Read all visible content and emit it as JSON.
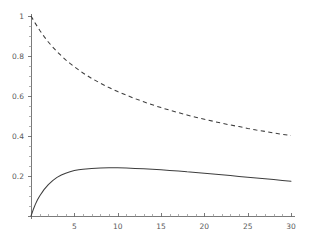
{
  "chart_data": {
    "type": "line",
    "title": "",
    "subtitle": "",
    "xlabel": "",
    "ylabel": "",
    "xlim": [
      0,
      30
    ],
    "ylim": [
      0,
      1
    ],
    "grid": false,
    "legend": "none",
    "background_color": "#ffffff",
    "axis_color": "#6b6b6b",
    "curve_color": "#3d3d3d",
    "x_ticks_major": [
      5,
      10,
      15,
      20,
      25,
      30
    ],
    "x_tick_labels": [
      "5",
      "10",
      "15",
      "20",
      "25",
      "30"
    ],
    "x_tick_minor_step": 1,
    "y_ticks_major": [
      0.2,
      0.4,
      0.6,
      0.8,
      1
    ],
    "y_tick_labels": [
      "0.2",
      "0.4",
      "0.6",
      "0.8",
      "1"
    ],
    "y_tick_minor_step": 0.05,
    "series": [
      {
        "name": "dashed-decay-curve",
        "style": "dashed",
        "x": [
          0,
          0.5,
          1,
          1.5,
          2,
          2.5,
          3,
          3.5,
          4,
          4.5,
          5,
          6,
          7,
          8,
          9,
          10,
          11,
          12,
          13,
          14,
          15,
          16,
          17,
          18,
          19,
          20,
          21,
          22,
          23,
          24,
          25,
          26,
          27,
          28,
          29,
          30
        ],
        "y": [
          1.0,
          0.963,
          0.929,
          0.898,
          0.87,
          0.845,
          0.822,
          0.801,
          0.781,
          0.763,
          0.746,
          0.715,
          0.688,
          0.664,
          0.642,
          0.622,
          0.604,
          0.587,
          0.571,
          0.556,
          0.542,
          0.529,
          0.517,
          0.505,
          0.494,
          0.484,
          0.474,
          0.464,
          0.455,
          0.447,
          0.438,
          0.43,
          0.423,
          0.415,
          0.408,
          0.402
        ]
      },
      {
        "name": "solid-rise-peak-decay-curve",
        "style": "solid",
        "x": [
          0,
          0.25,
          0.5,
          0.75,
          1,
          1.5,
          2,
          2.5,
          3,
          3.5,
          4,
          4.5,
          5,
          5.5,
          6,
          7,
          8,
          9,
          10,
          11,
          12,
          13,
          14,
          15,
          16,
          17,
          18,
          19,
          20,
          21,
          22,
          23,
          24,
          25,
          26,
          27,
          28,
          29,
          30
        ],
        "y": [
          0.0,
          0.031,
          0.058,
          0.081,
          0.1,
          0.132,
          0.157,
          0.177,
          0.193,
          0.205,
          0.214,
          0.221,
          0.227,
          0.231,
          0.234,
          0.238,
          0.24,
          0.241,
          0.241,
          0.24,
          0.238,
          0.236,
          0.234,
          0.231,
          0.228,
          0.225,
          0.221,
          0.218,
          0.214,
          0.21,
          0.206,
          0.202,
          0.198,
          0.194,
          0.19,
          0.186,
          0.182,
          0.178,
          0.174
        ]
      }
    ]
  },
  "plot_geometry": {
    "origin_x_px": 31,
    "origin_y_px": 216,
    "x_px_per_unit": 8.667,
    "y_px_per_unit": 200,
    "y_axis_top_px": 14,
    "x_axis_right_px": 295,
    "tick_major_len": 4,
    "tick_minor_len": 2.2
  }
}
